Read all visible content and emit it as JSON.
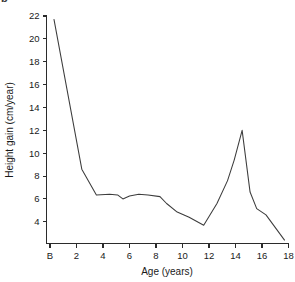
{
  "figure": {
    "panel_label": "b"
  },
  "chart_data": {
    "type": "line",
    "title": "",
    "xlabel": "Age (years)",
    "ylabel": "Height gain (cm/year)",
    "xlim": [
      0,
      18
    ],
    "ylim": [
      2.1,
      22
    ],
    "grid": false,
    "legend": "none",
    "xticks": [
      0,
      2,
      4,
      6,
      8,
      10,
      12,
      14,
      16,
      18
    ],
    "xticklabels": [
      "B",
      "2",
      "4",
      "6",
      "8",
      "10",
      "12",
      "14",
      "16",
      "18"
    ],
    "yticks": [
      4,
      6,
      8,
      10,
      12,
      14,
      16,
      18,
      20,
      22
    ],
    "yticklabels": [
      "4",
      "6",
      "8",
      "10",
      "12",
      "14",
      "16",
      "18",
      "20",
      "22"
    ],
    "series": [
      {
        "name": "Height velocity",
        "color": "#3c3c3c",
        "x": [
          0.3,
          2.4,
          3.5,
          4.5,
          5.1,
          5.5,
          6.0,
          6.7,
          7.4,
          8.3,
          8.8,
          9.6,
          10.5,
          11.6,
          12.6,
          13.4,
          13.9,
          14.5,
          15.1,
          15.6,
          16.3,
          17.7
        ],
        "y": [
          21.7,
          8.6,
          6.35,
          6.4,
          6.35,
          6.0,
          6.25,
          6.4,
          6.35,
          6.2,
          5.6,
          4.85,
          4.4,
          3.7,
          5.6,
          7.6,
          9.4,
          12.0,
          6.6,
          5.15,
          4.6,
          2.4
        ]
      }
    ],
    "annotations": []
  }
}
